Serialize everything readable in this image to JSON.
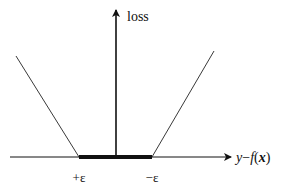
{
  "diagram": {
    "y_axis_label": "loss",
    "x_axis_label": {
      "y": "y",
      "minus": "−",
      "f": "f",
      "open": "(",
      "x": "x",
      "close": ")"
    },
    "tick_left": "+ε",
    "tick_right": "−ε",
    "colors": {
      "line": "#111111",
      "background": "#ffffff"
    }
  }
}
